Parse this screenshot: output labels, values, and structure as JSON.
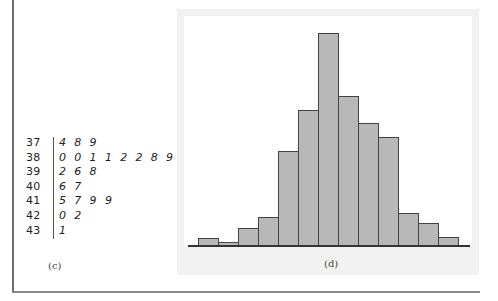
{
  "stem_leaf": {
    "label": "(c)",
    "rows": [
      {
        "stem": "37",
        "leaves": "4 8 9"
      },
      {
        "stem": "38",
        "leaves": "0 0 1 1 2 2 8 9"
      },
      {
        "stem": "39",
        "leaves": "2 6 8"
      },
      {
        "stem": "40",
        "leaves": "6 7"
      },
      {
        "stem": "41",
        "leaves": "5 7 9 9"
      },
      {
        "stem": "42",
        "leaves": "0 2"
      },
      {
        "stem": "43",
        "leaves": "1"
      }
    ]
  },
  "histogram": {
    "label": "(d)"
  },
  "chart_data": [
    {
      "type": "table",
      "title": "Stem-and-leaf display",
      "label": "(c)",
      "stems": [
        "37",
        "38",
        "39",
        "40",
        "41",
        "42",
        "43"
      ],
      "leaves": [
        [
          4,
          8,
          9
        ],
        [
          0,
          0,
          1,
          1,
          2,
          2,
          8,
          9
        ],
        [
          2,
          6,
          8
        ],
        [
          6,
          7
        ],
        [
          5,
          7,
          9,
          9
        ],
        [
          0,
          2
        ],
        [
          1
        ]
      ]
    },
    {
      "type": "bar",
      "title": "",
      "label": "(d)",
      "xlabel": "",
      "ylabel": "",
      "grid": false,
      "categories": [
        "1",
        "2",
        "3",
        "4",
        "5",
        "6",
        "7",
        "8",
        "9",
        "10",
        "11",
        "12",
        "13"
      ],
      "values": [
        8,
        4,
        18,
        29,
        95,
        136,
        213,
        150,
        123,
        109,
        33,
        23,
        9
      ],
      "note": "Relative bar heights in pixels; no axis ticks shown"
    }
  ]
}
